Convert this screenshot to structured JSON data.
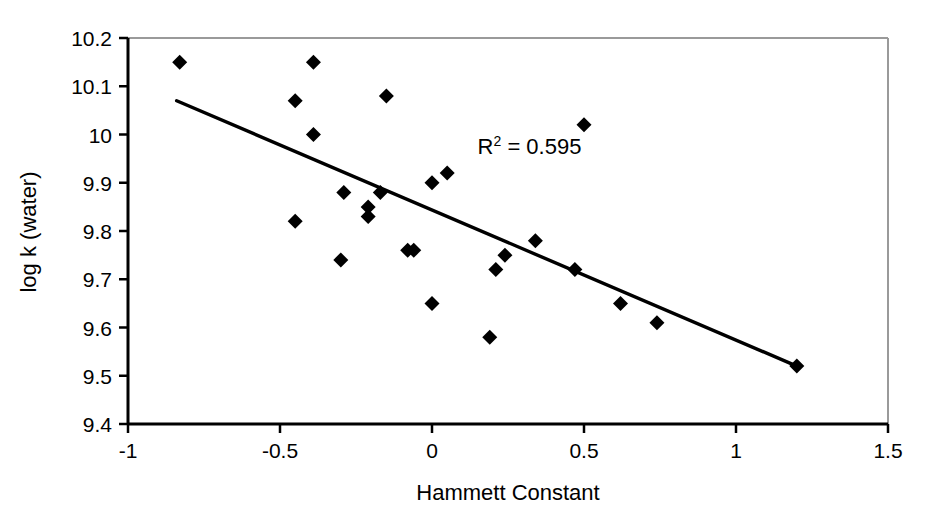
{
  "chart_data": {
    "type": "scatter",
    "title": "",
    "subtitle": "",
    "xlabel": "Hammett Constant",
    "ylabel": "log k (water)",
    "xlim": [
      -1,
      1.5
    ],
    "ylim": [
      9.4,
      10.2
    ],
    "xticks": [
      -1,
      -0.5,
      0,
      0.5,
      1,
      1.5
    ],
    "xtick_labels": [
      "-1",
      "-0.5",
      "0",
      "0.5",
      "1",
      "1.5"
    ],
    "yticks": [
      9.4,
      9.5,
      9.6,
      9.7,
      9.8,
      9.9,
      10.0,
      10.1,
      10.2
    ],
    "ytick_labels": [
      "9.4",
      "9.5",
      "9.6",
      "9.7",
      "9.8",
      "9.9",
      "10",
      "10.1",
      "10.2"
    ],
    "grid": false,
    "legend": "none",
    "marker": "diamond",
    "marker_color": "#000000",
    "points": [
      {
        "x": -0.83,
        "y": 10.15
      },
      {
        "x": -0.39,
        "y": 10.15
      },
      {
        "x": -0.45,
        "y": 10.07
      },
      {
        "x": -0.39,
        "y": 10.0
      },
      {
        "x": -0.15,
        "y": 10.08
      },
      {
        "x": 0.5,
        "y": 10.02
      },
      {
        "x": 0.05,
        "y": 9.92
      },
      {
        "x": 0.0,
        "y": 9.9
      },
      {
        "x": -0.29,
        "y": 9.88
      },
      {
        "x": -0.17,
        "y": 9.88
      },
      {
        "x": -0.21,
        "y": 9.85
      },
      {
        "x": -0.21,
        "y": 9.83
      },
      {
        "x": -0.45,
        "y": 9.82
      },
      {
        "x": 0.34,
        "y": 9.78
      },
      {
        "x": -0.08,
        "y": 9.76
      },
      {
        "x": -0.06,
        "y": 9.76
      },
      {
        "x": 0.24,
        "y": 9.75
      },
      {
        "x": -0.3,
        "y": 9.74
      },
      {
        "x": 0.21,
        "y": 9.72
      },
      {
        "x": 0.47,
        "y": 9.72
      },
      {
        "x": 0.62,
        "y": 9.65
      },
      {
        "x": 0.0,
        "y": 9.65
      },
      {
        "x": 0.74,
        "y": 9.61
      },
      {
        "x": 0.19,
        "y": 9.58
      },
      {
        "x": 1.2,
        "y": 9.52
      }
    ],
    "trendline": {
      "type": "linear",
      "x_start": -0.84,
      "y_start": 10.07,
      "x_end": 1.2,
      "y_end": 9.52,
      "color": "#000000"
    },
    "annotations": [
      {
        "name": "r-squared",
        "base": "R",
        "superscript": "2",
        "rest": " = 0.595",
        "text": "R2 = 0.595",
        "x": 0.15,
        "y": 9.96
      }
    ]
  },
  "axes": {
    "frame_color": "#000000",
    "background": "#ffffff"
  }
}
